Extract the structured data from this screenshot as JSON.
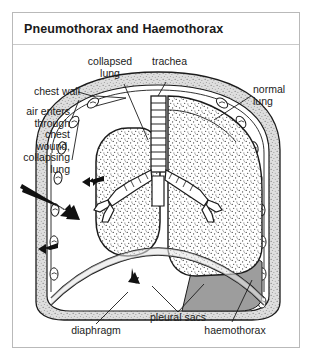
{
  "figure": {
    "title": "Pneumothorax and Haemothorax",
    "frame_color": "#b9b9b9",
    "background": "#ffffff",
    "ink_color": "#1b1b1b",
    "haemothorax_fill": "#9d9d9d",
    "chest_wall_fill": "#d8d8d8"
  },
  "labels": {
    "collapsed_lung": "collapsed\nlung",
    "chest_wall": "chest wall",
    "air_enters": "air enters\nthrough\nchest\nwound,\ncollapsing\nlung",
    "trachea": "trachea",
    "normal_lung": "normal\nlung",
    "pleural_sacs": "pleural sacs",
    "diaphragm": "diaphragm",
    "haemothorax": "haemothorax"
  },
  "structures": {
    "trachea_name": "trachea-tube",
    "bronchi_name": "bronchial-tree",
    "collapsed_lung_name": "collapsed-left-lung",
    "normal_lung_name": "normal-right-lung",
    "diaphragm_name": "diaphragm-dome",
    "chest_wall_name": "chest-wall-band",
    "haemothorax_name": "haemothorax-blood-pool",
    "wound_arrow_name": "chest-wound-air-arrow"
  }
}
